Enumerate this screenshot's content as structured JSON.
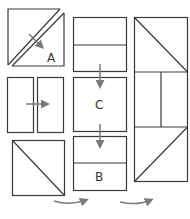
{
  "diagram": {
    "labels": {
      "a": "A",
      "b": "B",
      "c": "C"
    },
    "colors": {
      "stroke": "#3a3a3a",
      "arrow": "#7a7a7a",
      "background": "#ffffff"
    }
  }
}
